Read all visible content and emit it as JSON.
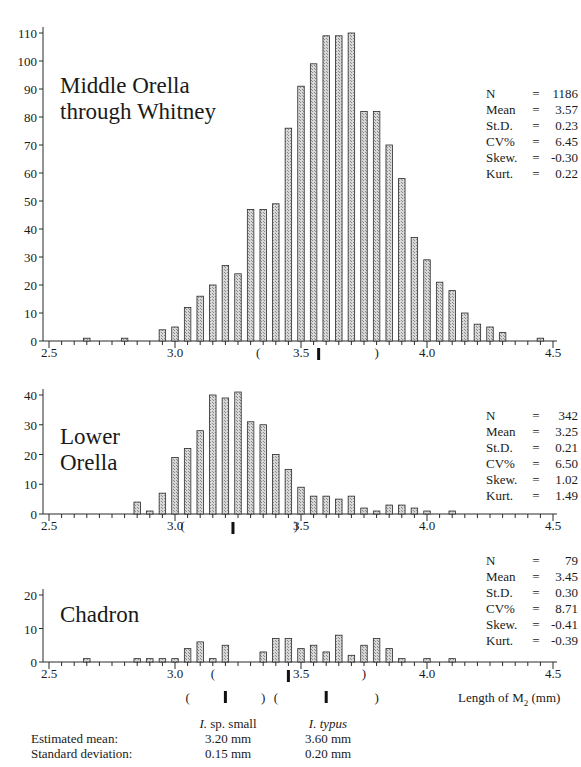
{
  "chart_data": [
    {
      "type": "bar",
      "title": "Middle Orella through Whitney",
      "xlabel": "",
      "ylabel": "",
      "xlim": [
        2.5,
        4.5
      ],
      "ylim": [
        0,
        110
      ],
      "yticks": [
        0,
        10,
        20,
        30,
        40,
        50,
        60,
        70,
        80,
        90,
        100,
        110
      ],
      "xticks": [
        "2.5",
        "3.0",
        "3.5",
        "4.0",
        "4.5"
      ],
      "bin_width": 0.05,
      "x": [
        2.65,
        2.8,
        2.95,
        3.0,
        3.05,
        3.1,
        3.15,
        3.2,
        3.25,
        3.3,
        3.35,
        3.4,
        3.45,
        3.5,
        3.55,
        3.6,
        3.65,
        3.7,
        3.75,
        3.8,
        3.85,
        3.9,
        3.95,
        4.0,
        4.05,
        4.1,
        4.15,
        4.2,
        4.25,
        4.3,
        4.45
      ],
      "values": [
        1,
        1,
        4,
        5,
        12,
        16,
        20,
        27,
        24,
        47,
        47,
        49,
        76,
        91,
        99,
        109,
        109,
        110,
        82,
        82,
        70,
        58,
        37,
        29,
        21,
        18,
        10,
        6,
        5,
        3,
        1
      ],
      "mean_marker": 3.57,
      "range_brackets": [
        3.33,
        3.8
      ],
      "stats": {
        "N": "1186",
        "Mean": "3.57",
        "St.D.": "0.23",
        "CV%": "6.45",
        "Skew.": "-0.30",
        "Kurt.": "0.22"
      }
    },
    {
      "type": "bar",
      "title": "Lower Orella",
      "xlim": [
        2.5,
        4.5
      ],
      "ylim": [
        0,
        40
      ],
      "yticks": [
        0,
        10,
        20,
        30,
        40
      ],
      "xticks": [
        "2.5",
        "3.0",
        "3.5",
        "4.0",
        "4.5"
      ],
      "bin_width": 0.05,
      "x": [
        2.85,
        2.9,
        2.95,
        3.0,
        3.05,
        3.1,
        3.15,
        3.2,
        3.25,
        3.3,
        3.35,
        3.4,
        3.45,
        3.5,
        3.55,
        3.6,
        3.65,
        3.7,
        3.75,
        3.8,
        3.85,
        3.9,
        3.95,
        4.0,
        4.1
      ],
      "values": [
        4,
        1,
        7,
        19,
        22,
        28,
        40,
        39,
        41,
        31,
        30,
        20,
        15,
        9,
        6,
        6,
        5,
        6,
        2,
        1,
        3,
        3,
        2,
        1,
        1
      ],
      "mean_marker": 3.23,
      "range_brackets": [
        3.03,
        3.48
      ],
      "stats": {
        "N": "342",
        "Mean": "3.25",
        "St.D.": "0.21",
        "CV%": "6.50",
        "Skew.": "1.02",
        "Kurt.": "1.49"
      }
    },
    {
      "type": "bar",
      "title": "Chadron",
      "xlabel": "Length of M2 (mm)",
      "xlim": [
        2.5,
        4.5
      ],
      "ylim": [
        0,
        20
      ],
      "yticks": [
        0,
        10,
        20
      ],
      "xticks": [
        "2.5",
        "3.0",
        "3.5",
        "4.0",
        "4.5"
      ],
      "bin_width": 0.05,
      "x": [
        2.65,
        2.85,
        2.9,
        2.95,
        3.0,
        3.05,
        3.1,
        3.15,
        3.2,
        3.35,
        3.4,
        3.45,
        3.5,
        3.55,
        3.6,
        3.65,
        3.7,
        3.75,
        3.8,
        3.85,
        3.9,
        4.0,
        4.1
      ],
      "values": [
        1,
        1,
        1,
        1,
        1,
        4,
        6,
        1,
        5,
        3,
        7,
        7,
        4,
        5,
        3,
        8,
        2,
        5,
        7,
        4,
        1,
        1,
        1
      ],
      "mean_marker": 3.45,
      "range_brackets": [
        3.15,
        3.75
      ],
      "stats": {
        "N": "79",
        "Mean": "3.45",
        "St.D.": "0.30",
        "CV%": "8.71",
        "Skew.": "-0.41",
        "Kurt.": "-0.39"
      }
    }
  ],
  "panels": [
    {
      "title_lines": [
        "Middle Orella",
        "through Whitney"
      ],
      "stats": [
        [
          "N",
          "=",
          "1186"
        ],
        [
          "Mean",
          "=",
          "3.57"
        ],
        [
          "St.D.",
          "=",
          "0.23"
        ],
        [
          "CV%",
          "=",
          "6.45"
        ],
        [
          "Skew.",
          "=",
          "-0.30"
        ],
        [
          "Kurt.",
          "=",
          "0.22"
        ]
      ]
    },
    {
      "title_lines": [
        "Lower",
        "Orella"
      ],
      "stats": [
        [
          "N",
          "=",
          "342"
        ],
        [
          "Mean",
          "=",
          "3.25"
        ],
        [
          "St.D.",
          "=",
          "0.21"
        ],
        [
          "CV%",
          "=",
          "6.50"
        ],
        [
          "Skew.",
          "=",
          "1.02"
        ],
        [
          "Kurt.",
          "=",
          "1.49"
        ]
      ]
    },
    {
      "title_lines": [
        "Chadron"
      ],
      "stats": [
        [
          "N",
          "=",
          "79"
        ],
        [
          "Mean",
          "=",
          "3.45"
        ],
        [
          "St.D.",
          "=",
          "0.30"
        ],
        [
          "CV%",
          "=",
          "8.71"
        ],
        [
          "Skew.",
          "=",
          "-0.41"
        ],
        [
          "Kurt.",
          "=",
          "-0.39"
        ]
      ]
    }
  ],
  "axis": {
    "xlabel_main": "Length of M",
    "xlabel_sub": "2",
    "xlabel_unit": " (mm)"
  },
  "footer": {
    "row_labels": [
      "Estimated mean:",
      "Standard deviation:"
    ],
    "groups": [
      {
        "name_genus": "I.",
        "name_rest": " sp. small",
        "mean": "3.20 mm",
        "sd": "0.15 mm",
        "center": 3.2,
        "brackets": [
          3.05,
          3.35
        ]
      },
      {
        "name_genus": "I. typus",
        "name_rest": "",
        "mean": "3.60 mm",
        "sd": "0.20 mm",
        "center": 3.6,
        "brackets": [
          3.4,
          3.8
        ]
      }
    ]
  },
  "colors": {
    "bar_fill": "#c8c8c8",
    "bar_stroke": "#2a2a2a",
    "axis": "#2a2a2a"
  }
}
